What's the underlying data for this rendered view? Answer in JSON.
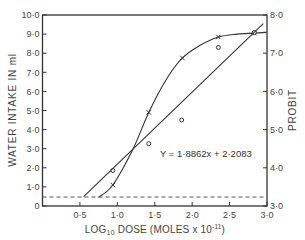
{
  "chart_data": {
    "type": "line",
    "title": "",
    "xlabel": "LOG10 DOSE (MOLES x 10^-11)",
    "xlabel_parts": {
      "pre": "LOG",
      "sub": "10",
      "mid": " DOSE  (MOLES x 10",
      "sup": "-11",
      "post": ")"
    },
    "ylabel": "WATER INTAKE IN ml",
    "y2label": "PROBIT",
    "xlim": [
      0,
      3.0
    ],
    "ylim": [
      0,
      10.0
    ],
    "y2lim": [
      3.0,
      8.0
    ],
    "grid": false,
    "x_ticks": [
      {
        "value": 0.5,
        "label": "0·5"
      },
      {
        "value": 1.0,
        "label": "1·0"
      },
      {
        "value": 1.5,
        "label": "1·5"
      },
      {
        "value": 2.0,
        "label": "2·0"
      },
      {
        "value": 2.5,
        "label": "2·5"
      },
      {
        "value": 3.0,
        "label": "3·0"
      }
    ],
    "y_ticks": [
      {
        "value": 0,
        "label": "0"
      },
      {
        "value": 1,
        "label": "1·0"
      },
      {
        "value": 2,
        "label": "2·0"
      },
      {
        "value": 3,
        "label": "3·0"
      },
      {
        "value": 4,
        "label": "4·0"
      },
      {
        "value": 5,
        "label": "5·0"
      },
      {
        "value": 6,
        "label": "6·0"
      },
      {
        "value": 7,
        "label": "7·0"
      },
      {
        "value": 8,
        "label": "8·0"
      },
      {
        "value": 9,
        "label": "9·0"
      },
      {
        "value": 10,
        "label": "10·0"
      }
    ],
    "y2_ticks": [
      {
        "value": 3,
        "label": "3·0"
      },
      {
        "value": 4,
        "label": "4·0"
      },
      {
        "value": 5,
        "label": "5·0"
      },
      {
        "value": 6,
        "label": "6·0"
      },
      {
        "value": 7,
        "label": "7·0"
      },
      {
        "value": 8,
        "label": "8·0"
      }
    ],
    "series": [
      {
        "name": "Water intake (ml)",
        "marker": "x",
        "axis": "left",
        "x": [
          0.94,
          1.42,
          1.87,
          2.35,
          2.83
        ],
        "y": [
          1.1,
          4.9,
          7.75,
          8.85,
          9.05
        ],
        "curve": {
          "x": [
            0.75,
            0.94,
            1.2,
            1.42,
            1.65,
            1.87,
            2.1,
            2.35,
            2.6,
            2.83,
            3.0
          ],
          "y": [
            0.45,
            1.1,
            2.9,
            4.9,
            6.6,
            7.75,
            8.4,
            8.85,
            9.0,
            9.05,
            9.1
          ]
        }
      },
      {
        "name": "Probit",
        "marker": "o",
        "axis": "right",
        "x": [
          0.94,
          1.42,
          1.86,
          2.35,
          2.83
        ],
        "y": [
          3.93,
          4.63,
          5.25,
          7.15,
          7.54
        ]
      },
      {
        "name": "Probit regression",
        "type": "fit_line",
        "axis": "right",
        "equation": "Y = 1·8862x + 2·2083",
        "slope": 1.8862,
        "intercept": 2.2083,
        "x_range": [
          0.55,
          2.95
        ]
      },
      {
        "name": "Baseline",
        "type": "dashed_hline",
        "axis": "left",
        "y": 0.47
      }
    ],
    "annotations": [
      {
        "text": "Y = 1·8862x + 2·2083",
        "x": 1.6,
        "y_probit": 4.5
      }
    ],
    "legend": null
  }
}
